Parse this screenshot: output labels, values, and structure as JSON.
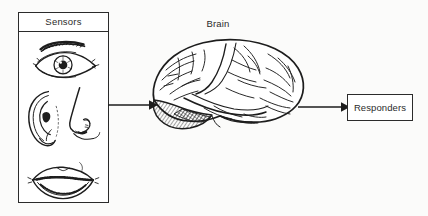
{
  "diagram": {
    "sensors_panel": {
      "title": "Sensors",
      "organs": [
        {
          "name": "eye",
          "icon": "eye-illustration"
        },
        {
          "name": "ear-and-nose",
          "icon": "ear-nose-illustration"
        },
        {
          "name": "mouth",
          "icon": "mouth-illustration"
        }
      ]
    },
    "brain": {
      "label": "Brain",
      "icon": "brain-illustration",
      "shaded_region": "cerebellum-hatched"
    },
    "responders_box": {
      "label": "Responders"
    },
    "arrows": [
      {
        "name": "sensors-to-brain",
        "icon": "arrow-right-icon"
      },
      {
        "name": "brain-to-responders",
        "icon": "arrow-right-icon"
      }
    ],
    "colors": {
      "ink": "#2b2b2b",
      "background": "#fbfbfa",
      "panel": "#ffffff"
    }
  }
}
